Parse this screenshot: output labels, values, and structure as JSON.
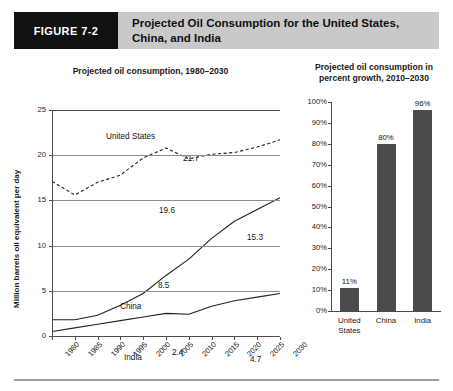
{
  "figure": {
    "badge_label": "FIGURE 7-2",
    "title": "Projected Oil Consumption for the United States, China, and India",
    "badge_bg": "#111111",
    "header_bg": "#c9c9c9"
  },
  "line_chart": {
    "title": "Projected oil consumption, 1980–2030",
    "y_axis_title": "Million barrels oil equivalent per day",
    "y_ticks": [
      "0",
      "5",
      "10",
      "15",
      "20",
      "25"
    ],
    "x_ticks": [
      "1980",
      "1985",
      "1990",
      "1995",
      "2000",
      "2005",
      "2010",
      "2015",
      "2020",
      "2025",
      "2030"
    ],
    "series_labels": {
      "us": "United States",
      "china": "China",
      "india": "India"
    },
    "value_labels": {
      "us_mid": "19.6",
      "us_end": "21.7",
      "china_mid": "8.5",
      "china_end": "15.3",
      "india_mid": "2.4",
      "india_end": "4.7"
    }
  },
  "bar_chart": {
    "title": "Projected oil consumption in\npercent growth, 2010–2030",
    "y_ticks": [
      "0%",
      "10%",
      "20%",
      "30%",
      "40%",
      "50%",
      "60%",
      "70%",
      "80%",
      "90%",
      "100%"
    ],
    "categories": [
      "United\nStates",
      "China",
      "India"
    ],
    "value_labels": [
      "11%",
      "80%",
      "96%"
    ],
    "bar_color": "#4b4b4b"
  },
  "chart_data": [
    {
      "type": "line",
      "title": "Projected oil consumption, 1980–2030",
      "xlabel": "",
      "ylabel": "Million barrels oil equivalent per day",
      "x": [
        1980,
        1985,
        1990,
        1995,
        2000,
        2005,
        2010,
        2015,
        2020,
        2025,
        2030
      ],
      "xlim": [
        1980,
        2030
      ],
      "ylim": [
        0,
        25
      ],
      "yticks": [
        0,
        5,
        10,
        15,
        20,
        25
      ],
      "grid": true,
      "legend": "inline-labels",
      "series": [
        {
          "name": "United States",
          "style": "dashed",
          "values": [
            17.1,
            15.6,
            17.0,
            17.8,
            19.7,
            20.8,
            19.6,
            20.1,
            20.3,
            20.9,
            21.7
          ],
          "annotations": [
            {
              "x": 2010,
              "value": 19.6,
              "label": "19.6"
            },
            {
              "x": 2030,
              "value": 21.7,
              "label": "21.7"
            }
          ]
        },
        {
          "name": "China",
          "style": "solid",
          "values": [
            1.8,
            1.8,
            2.3,
            3.4,
            4.7,
            6.7,
            8.5,
            10.8,
            12.7,
            14.0,
            15.3
          ],
          "annotations": [
            {
              "x": 2010,
              "value": 8.5,
              "label": "8.5"
            },
            {
              "x": 2030,
              "value": 15.3,
              "label": "15.3"
            }
          ]
        },
        {
          "name": "India",
          "style": "solid",
          "values": [
            0.5,
            0.9,
            1.3,
            1.7,
            2.1,
            2.5,
            2.4,
            3.3,
            3.9,
            4.3,
            4.7
          ],
          "annotations": [
            {
              "x": 2010,
              "value": 2.4,
              "label": "2.4"
            },
            {
              "x": 2030,
              "value": 4.7,
              "label": "4.7"
            }
          ]
        }
      ]
    },
    {
      "type": "bar",
      "title": "Projected oil consumption in percent growth, 2010–2030",
      "xlabel": "",
      "ylabel": "",
      "categories": [
        "United States",
        "China",
        "India"
      ],
      "values": [
        11,
        80,
        96
      ],
      "value_labels": [
        "11%",
        "80%",
        "96%"
      ],
      "ylim": [
        0,
        100
      ],
      "yticks": [
        0,
        10,
        20,
        30,
        40,
        50,
        60,
        70,
        80,
        90,
        100
      ],
      "ytick_labels": [
        "0%",
        "10%",
        "20%",
        "30%",
        "40%",
        "50%",
        "60%",
        "70%",
        "80%",
        "90%",
        "100%"
      ],
      "grid": false,
      "bar_color": "#4b4b4b"
    }
  ]
}
